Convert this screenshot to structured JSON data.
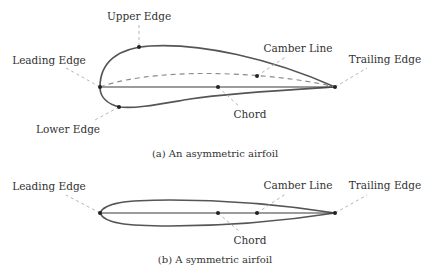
{
  "figure_a": {
    "caption": "(a) An asymmetric airfoil",
    "labels": {
      "upper_edge": "Upper Edge",
      "leading_edge": "Leading Edge",
      "lower_edge": "Lower Edge",
      "camber_line": "Camber Line",
      "trailing_edge": "Trailing Edge",
      "chord": "Chord"
    }
  },
  "figure_b": {
    "caption": "(b) A symmetric airfoil",
    "labels": {
      "leading_edge": "Leading Edge",
      "camber_line": "Camber Line",
      "trailing_edge": "Trailing Edge",
      "chord": "Chord"
    }
  },
  "colors": {
    "outline": "#555555",
    "chord": "#3a3a3a",
    "camber": "#8a8a8a",
    "leader": "#b5b5b5",
    "text": "#333333"
  }
}
